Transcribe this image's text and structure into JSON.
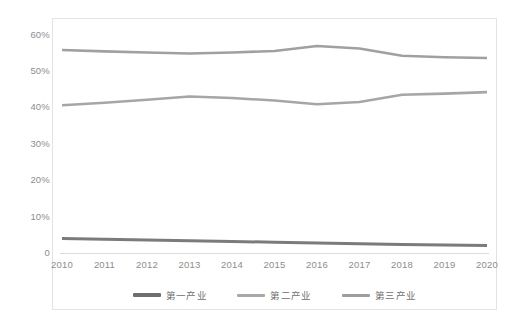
{
  "chart_data": {
    "type": "line",
    "title": "",
    "xlabel": "",
    "ylabel": "",
    "x": [
      2010,
      2011,
      2012,
      2013,
      2014,
      2015,
      2016,
      2017,
      2018,
      2019,
      2020
    ],
    "xtick_labels": [
      "2010",
      "2011",
      "2012",
      "2013",
      "2014",
      "2015",
      "2016",
      "2017",
      "2018",
      "2019",
      "2020"
    ],
    "ytick_labels": [
      "0",
      "10%",
      "20%",
      "30%",
      "40%",
      "50%",
      "60%"
    ],
    "ytick_values": [
      0,
      10,
      20,
      30,
      40,
      50,
      60
    ],
    "ylim": [
      0,
      60
    ],
    "grid": false,
    "legend_position": "bottom",
    "series": [
      {
        "name": "第一产业",
        "color": "#7b7b7b",
        "values": [
          4.1,
          3.9,
          3.7,
          3.5,
          3.3,
          3.1,
          2.9,
          2.7,
          2.5,
          2.3,
          2.2
        ]
      },
      {
        "name": "第二产业",
        "color": "#a6a6a6",
        "values": [
          40.7,
          41.4,
          42.2,
          43.1,
          42.7,
          42.0,
          41.0,
          41.6,
          43.6,
          43.9,
          44.3
        ]
      },
      {
        "name": "第三产业",
        "color": "#a0a0a0",
        "values": [
          55.9,
          55.5,
          55.2,
          54.9,
          55.2,
          55.6,
          57.0,
          56.3,
          54.3,
          53.9,
          53.7
        ]
      }
    ]
  },
  "legend": {
    "items": [
      {
        "label": "第一产业",
        "color": "#6e6e6e"
      },
      {
        "label": "第二产业",
        "color": "#a8a8a8"
      },
      {
        "label": "第三产业",
        "color": "#9e9e9e"
      }
    ]
  },
  "caption": {
    "text": ""
  }
}
